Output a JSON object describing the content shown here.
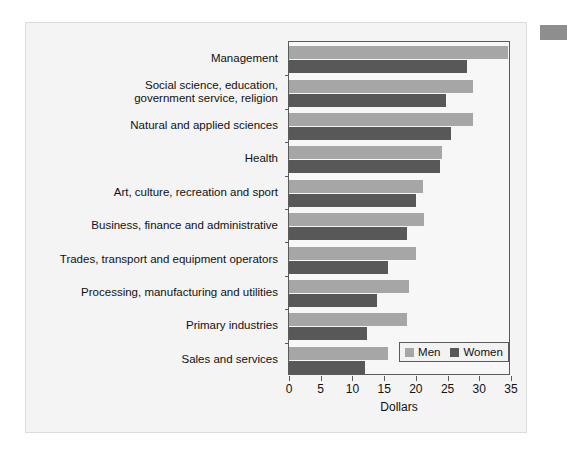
{
  "chart_data": {
    "type": "bar",
    "orientation": "horizontal",
    "title": "",
    "xlabel": "Dollars",
    "ylabel": "",
    "xlim": [
      0,
      35
    ],
    "xticks": [
      0,
      5,
      10,
      15,
      20,
      25,
      30,
      35
    ],
    "xtick_labels": [
      "0",
      "5",
      "10",
      "15",
      "20",
      "25",
      "30",
      "35"
    ],
    "grid": false,
    "legend_position": "lower right",
    "categories": [
      "Management",
      "Social science, education,\ngovernment service, religion",
      "Natural and applied sciences",
      "Health",
      "Art, culture, recreation and sport",
      "Business, finance and administrative",
      "Trades, transport and equipment operators",
      "Processing, manufacturing and utilities",
      "Primary industries",
      "Sales and services"
    ],
    "series": [
      {
        "name": "Men",
        "color": "#a6a6a6",
        "values": [
          34.5,
          29.0,
          29.0,
          24.2,
          21.1,
          21.3,
          20.0,
          18.9,
          18.6,
          15.6
        ]
      },
      {
        "name": "Women",
        "color": "#585858",
        "values": [
          28.0,
          24.7,
          25.6,
          23.8,
          20.0,
          18.6,
          15.6,
          13.8,
          12.3,
          12.0
        ]
      }
    ]
  },
  "legend": {
    "entries": [
      {
        "label": "Men"
      },
      {
        "label": "Women"
      }
    ]
  },
  "colors": {
    "men": "#a6a6a6",
    "women": "#585858",
    "panel_background": "#f4f4f4",
    "axis": "#5a5a5a",
    "text": "#111111"
  }
}
